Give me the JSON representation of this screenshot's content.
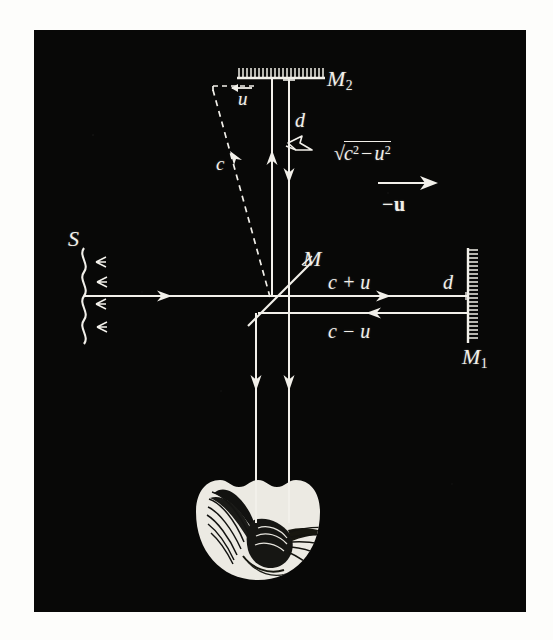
{
  "figure": {
    "caption": "",
    "background_color": "#fdfdfb",
    "plate_color": "#080807",
    "ink_color": "#f2f0ea"
  },
  "labels": {
    "source": "S",
    "beam_splitter": "M",
    "mirror_horizontal": "M",
    "mirror_horizontal_sub": "1",
    "mirror_vertical": "M",
    "mirror_vertical_sub": "2",
    "drift_speed": "u",
    "light_speed": "c",
    "arm_length_vertical": "d",
    "arm_length_horizontal": "d",
    "transverse_speed_radicand": "c",
    "transverse_speed_radicand_sup": "2",
    "transverse_speed_minus": "−",
    "transverse_speed_second": "u",
    "transverse_speed_second_sup": "2",
    "ether_wind_vector": "−u",
    "outbound_speed": "c + u",
    "return_speed": "c − u"
  },
  "elements": {
    "source_name": "slit-source",
    "beam_splitter_name": "half-silvered-mirror",
    "mirror1_name": "mirror-M1",
    "mirror2_name": "mirror-M2",
    "observer_name": "observer-eye",
    "dashed_path_name": "ether-drift-light-path"
  },
  "physics_data": {
    "type": "diagram",
    "apparatus": "Michelson-Morley interferometer",
    "arms": [
      {
        "id": "horizontal",
        "mirror": "M1",
        "length": "d",
        "outbound_speed": "c + u",
        "return_speed": "c − u"
      },
      {
        "id": "vertical",
        "mirror": "M2",
        "length": "d",
        "effective_speed": "√(c² − u²)"
      }
    ],
    "drift_vector": "−u",
    "drift_magnitude": "u",
    "light_speed": "c"
  }
}
